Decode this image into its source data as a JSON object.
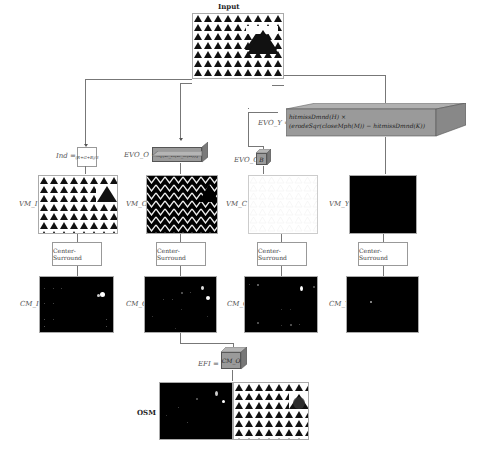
{
  "input": {
    "title": "Input"
  },
  "formulas": {
    "ind_label": "Ind =",
    "ind_expr": "(R+G+B)/3",
    "evo_o_label": "EVO_O =",
    "evo_o_expr": "½[(D_R(D_S(K))]",
    "evo_y_label": "EVO_Y =",
    "evo_y_line1": "hitmissDmnd(H) ×",
    "evo_y_line2": "(erodeSqr(closeMph(M)) − hitmissDmnd(K))",
    "evo_c_label": "EVO_C =",
    "evo_c_expr": "B",
    "efi_label": "EFI =",
    "efi_expr": "CM_O"
  },
  "columns": [
    {
      "vm_label": "VM_I",
      "cs_label": "Center-Surround",
      "cm_label": "CM_I",
      "vm_style": "triangles"
    },
    {
      "vm_label": "VM_O",
      "cs_label": "Center-Surround",
      "cm_label": "CM_O",
      "vm_style": "zigzag"
    },
    {
      "vm_label": "VM_C",
      "cs_label": "Center-Surround",
      "cm_label": "CM_C",
      "vm_style": "white"
    },
    {
      "vm_label": "VM_Y",
      "cs_label": "Center-Surround",
      "cm_label": "CM_Y",
      "vm_style": "black"
    }
  ],
  "output": {
    "label": "OSM"
  },
  "colors": {
    "box_fill": "#9a9a9a",
    "line": "#777777",
    "map_bg": "#000000"
  }
}
